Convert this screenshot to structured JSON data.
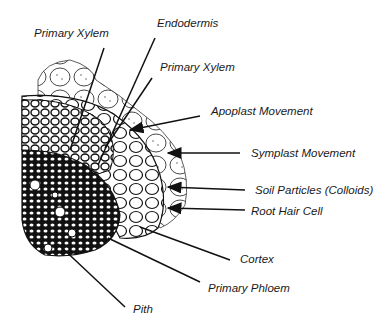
{
  "diagram": {
    "labels": {
      "primary_xylem_top": "Primary Xylem",
      "endodermis": "Endodermis",
      "primary_xylem_right": "Primary Xylem",
      "apoplast_movement": "Apoplast Movement",
      "symplast_movement": "Symplast Movement",
      "soil_particles": "Soil Particles (Colloids)",
      "root_hair_cell": "Root Hair Cell",
      "cortex": "Cortex",
      "primary_phloem": "Primary Phloem",
      "pith": "Pith"
    },
    "colors": {
      "ink": "#1a1a1a",
      "background": "#ffffff"
    }
  }
}
